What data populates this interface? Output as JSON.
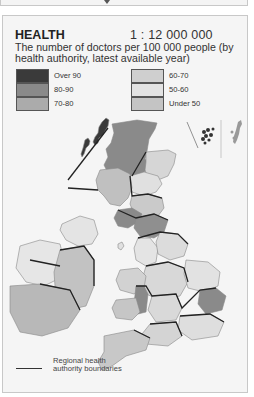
{
  "header": {
    "title": "HEALTH",
    "scale": "1 : 12 000 000",
    "subtitle": "The number of doctors per 100 000 people (by health authority, latest available year)"
  },
  "legend": {
    "items": [
      {
        "label": "Over 90",
        "color": "#3a3a3a"
      },
      {
        "label": "80-90",
        "color": "#8a8a8a"
      },
      {
        "label": "70-80",
        "color": "#ababab"
      },
      {
        "label": "60-70",
        "color": "#cfcfcf"
      },
      {
        "label": "50-60",
        "color": "#e2e2e2"
      },
      {
        "label": "Under 50",
        "color": "#c4c4c4"
      }
    ],
    "boundary_label": "Regional health authority boundaries"
  },
  "icons": {
    "prev_panel_arrow": "chevron-down-icon"
  }
}
